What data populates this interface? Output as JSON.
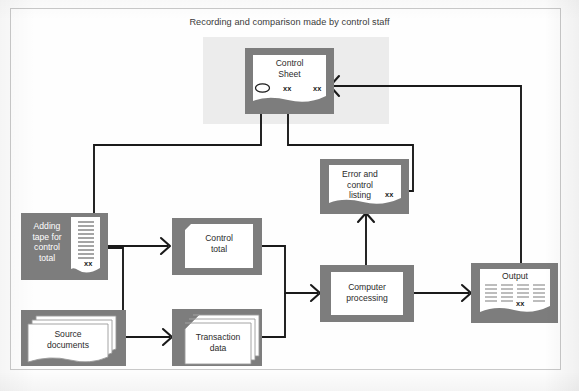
{
  "diagram": {
    "caption": "Recording and comparison made by control staff",
    "marker_text": "xx",
    "colors": {
      "shape_fill": "#7d7d7d",
      "paper": "#ffffff",
      "line": "#1a1a1a",
      "band": "#ececec",
      "frame": "#c9c9c9"
    },
    "nodes": [
      {
        "id": "control-sheet",
        "label": "Control\nSheet",
        "shape": "document",
        "markers": [
          "xx",
          "xx"
        ],
        "has_circle_marker": true
      },
      {
        "id": "adding-tape",
        "label": "Adding\ntape for\ncontrol\ntotal",
        "shape": "adding-tape",
        "markers": [
          "xx"
        ],
        "label_color": "white"
      },
      {
        "id": "source-documents",
        "label": "Source\ndocuments",
        "shape": "document-stack",
        "markers": []
      },
      {
        "id": "control-total",
        "label": "Control\ntotal",
        "shape": "punched-card",
        "markers": []
      },
      {
        "id": "transaction-data",
        "label": "Transaction\ndata",
        "shape": "punched-card-stack",
        "markers": []
      },
      {
        "id": "computer-processing",
        "label": "Computer\nprocessing",
        "shape": "process-rectangle",
        "markers": []
      },
      {
        "id": "error-control-listing",
        "label": "Error and\ncontrol\nlisting",
        "shape": "document",
        "markers": [
          "xx"
        ]
      },
      {
        "id": "output",
        "label": "Output",
        "shape": "printout",
        "markers": [
          "xx"
        ]
      }
    ],
    "flows": [
      {
        "from": "source-documents",
        "to": "adding-tape"
      },
      {
        "from": "adding-tape",
        "to": "control-total"
      },
      {
        "from": "source-documents",
        "to": "transaction-data"
      },
      {
        "from": "control-total",
        "to": "computer-processing"
      },
      {
        "from": "transaction-data",
        "to": "computer-processing"
      },
      {
        "from": "computer-processing",
        "to": "error-control-listing"
      },
      {
        "from": "computer-processing",
        "to": "output"
      },
      {
        "from": "adding-tape",
        "to": "control-sheet"
      },
      {
        "from": "error-control-listing",
        "to": "control-sheet"
      },
      {
        "from": "output",
        "to": "control-sheet"
      }
    ]
  }
}
